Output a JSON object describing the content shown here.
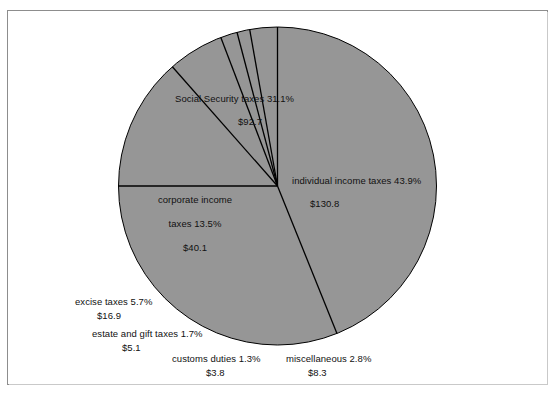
{
  "caption": "Sources of Federal Tax Revenue:",
  "chart_data": {
    "type": "pie",
    "title": "Sources of Federal Tax Revenue:",
    "value_prefix": "$",
    "slice_fill": "#969696",
    "slice_stroke": "#000000",
    "center": {
      "x": 277.5,
      "y": 186
    },
    "radius": 159,
    "start_angle_deg": 0,
    "categories": [
      "individual income taxes",
      "Social Security taxes",
      "corporate income taxes",
      "excise taxes",
      "estate and gift taxes",
      "customs duties",
      "miscellaneous"
    ],
    "percents": [
      43.9,
      31.1,
      13.5,
      5.7,
      1.7,
      1.3,
      2.8
    ],
    "values": [
      130.8,
      92.7,
      40.1,
      16.9,
      5.1,
      3.8,
      8.3
    ],
    "slices": [
      {
        "name": "individual income taxes",
        "percent_label": "individual income taxes 43.9%",
        "value_label": "$130.8",
        "percent": 43.9,
        "value": 130.8
      },
      {
        "name": "Social Security taxes",
        "percent_label": "Social Security taxes 31.1%",
        "value_label": "$92.7",
        "percent": 31.1,
        "value": 92.7
      },
      {
        "name": "corporate income taxes",
        "percent_label_l1": "corporate income",
        "percent_label_l2": "taxes 13.5%",
        "value_label": "$40.1",
        "percent": 13.5,
        "value": 40.1
      },
      {
        "name": "excise taxes",
        "percent_label": "excise taxes 5.7%",
        "value_label": "$16.9",
        "percent": 5.7,
        "value": 16.9
      },
      {
        "name": "estate and gift taxes",
        "percent_label": "estate and gift taxes 1.7%",
        "value_label": "$5.1",
        "percent": 1.7,
        "value": 5.1
      },
      {
        "name": "customs duties",
        "percent_label": "customs duties 1.3%",
        "value_label": "$3.8",
        "percent": 1.3,
        "value": 3.8
      },
      {
        "name": "miscellaneous",
        "percent_label": "miscellaneous 2.8%",
        "value_label": "$8.3",
        "percent": 2.8,
        "value": 8.3
      }
    ],
    "legend": "none",
    "grid": false
  },
  "labels": {
    "social_security": {
      "line1": "Social Security taxes 31.1%",
      "line2": "$92.7"
    },
    "individual": {
      "line1": "individual income taxes 43.9%",
      "line2": "$130.8"
    },
    "corporate": {
      "line1": "corporate income",
      "line2": "taxes 13.5%",
      "line3": "$40.1"
    },
    "excise": {
      "line1": "excise taxes 5.7%",
      "line2": "$16.9"
    },
    "estate": {
      "line1": "estate and gift taxes 1.7%",
      "line2": "$5.1"
    },
    "customs": {
      "line1": "customs duties 1.3%",
      "line2": "$3.8"
    },
    "miscellaneous": {
      "line1": "miscellaneous 2.8%",
      "line2": "$8.3"
    }
  }
}
